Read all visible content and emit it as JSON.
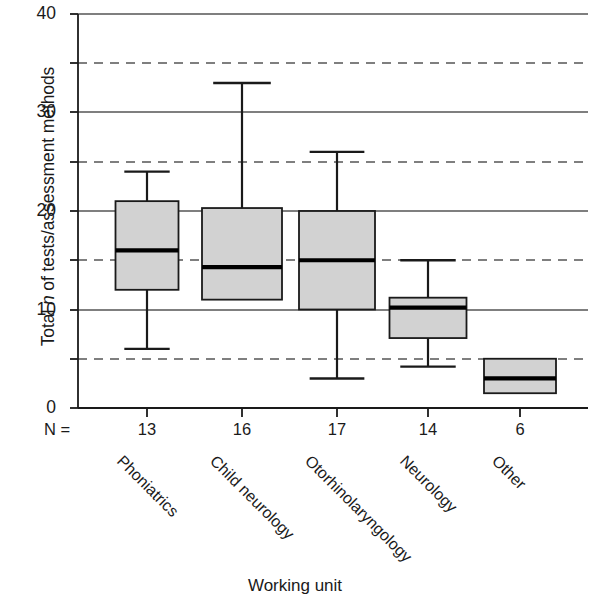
{
  "chart_data": {
    "type": "boxplot",
    "title": "",
    "xlabel": "Working unit",
    "ylabel": "Total n of tests/assessment methods",
    "ylim": [
      0,
      40
    ],
    "yticks": [
      0,
      5,
      10,
      15,
      20,
      25,
      30,
      35,
      40
    ],
    "ytick_labels_major": [
      "0",
      "10",
      "20",
      "30",
      "40"
    ],
    "grid": "horizontal gridlines: solid at 0/10/20/30/40, dashed at 5/15/25/35",
    "legend": "none",
    "n_row_label": "N =",
    "categories": [
      "Phoniatrics",
      "Child neurology",
      "Otorhinolaryngology",
      "Neurology",
      "Other"
    ],
    "counts": [
      13,
      16,
      17,
      14,
      6
    ],
    "boxes": [
      {
        "category": "Phoniatrics",
        "n": 13,
        "whisker_low": 6,
        "q1": 12,
        "median": 16,
        "q3": 21,
        "whisker_high": 24
      },
      {
        "category": "Child neurology",
        "n": 16,
        "whisker_low": 11,
        "q1": 11,
        "median": 14.3,
        "q3": 20.3,
        "whisker_high": 33
      },
      {
        "category": "Otorhinolaryngology",
        "n": 17,
        "whisker_low": 3,
        "q1": 10,
        "median": 15,
        "q3": 20,
        "whisker_high": 26
      },
      {
        "category": "Neurology",
        "n": 14,
        "whisker_low": 4.2,
        "q1": 7.1,
        "median": 10.2,
        "q3": 11.2,
        "whisker_high": 15
      },
      {
        "category": "Other",
        "n": 6,
        "whisker_low": 1.5,
        "q1": 1.5,
        "median": 3,
        "q3": 5,
        "whisker_high": 5
      }
    ],
    "colors": {
      "box_fill": "#d2d2d2",
      "box_stroke": "#1a1a1a",
      "median": "#000000",
      "gridline": "#555555",
      "axis": "#1a1a1a",
      "background": "#ffffff"
    }
  },
  "axis": {
    "y_title_prefix": "Total ",
    "y_title_italic": "n",
    "y_title_suffix": " of tests/assessment methods",
    "x_title": "Working unit"
  }
}
